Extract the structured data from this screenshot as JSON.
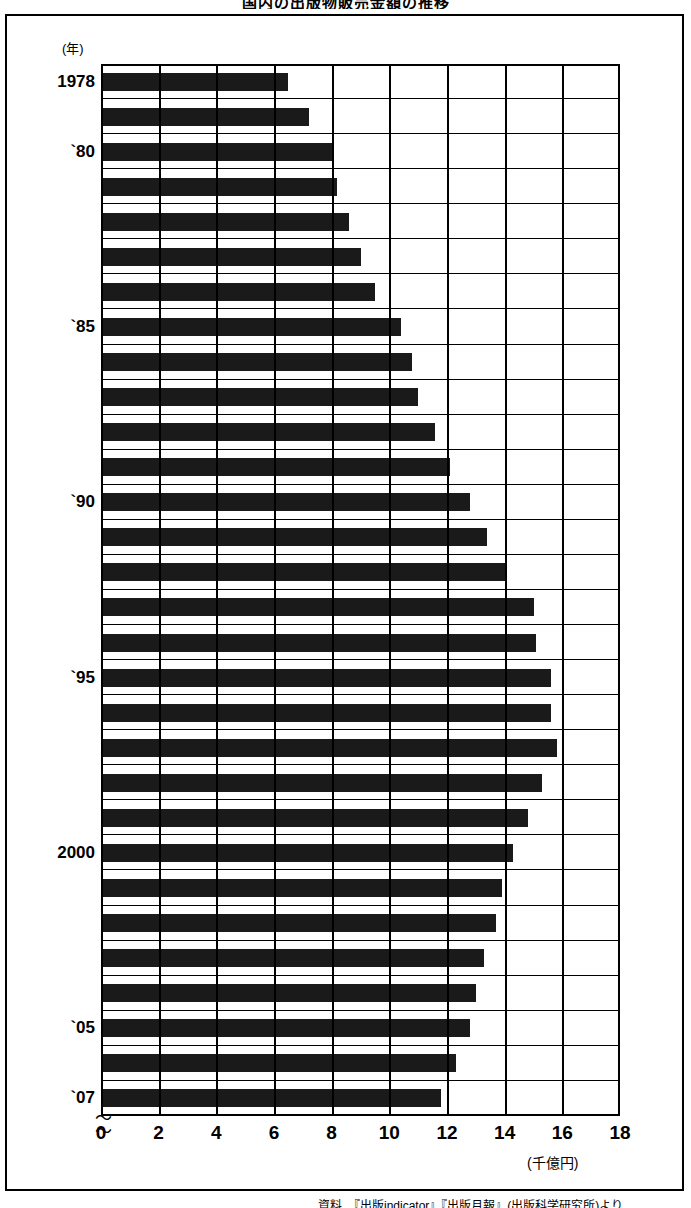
{
  "title": "国内の出版物販売金額の推移",
  "source": "資料　『出版indicator』『出版月報』(出版科学研究所)より",
  "y_axis": {
    "unit_label": "(年)",
    "tick_labels": [
      {
        "year": 1978,
        "text": "1978"
      },
      {
        "year": 1980,
        "text": "`80"
      },
      {
        "year": 1985,
        "text": "`85"
      },
      {
        "year": 1990,
        "text": "`90"
      },
      {
        "year": 1995,
        "text": "`95"
      },
      {
        "year": 2000,
        "text": "2000"
      },
      {
        "year": 2005,
        "text": "`05"
      },
      {
        "year": 2007,
        "text": "`07"
      }
    ]
  },
  "x_axis": {
    "unit_label": "(千億円)",
    "tick_labels": [
      "0",
      "2",
      "4",
      "6",
      "8",
      "10",
      "12",
      "14",
      "16",
      "18"
    ]
  },
  "colors": {
    "bar": "#1a1a1a",
    "axis": "#000000",
    "background": "#ffffff"
  },
  "chart_data": {
    "type": "bar",
    "orientation": "horizontal",
    "title": "国内の出版物販売金額の推移",
    "xlabel": "(千億円)",
    "ylabel": "(年)",
    "xlim": [
      0,
      18
    ],
    "xticks": [
      0,
      2,
      4,
      6,
      8,
      10,
      12,
      14,
      16,
      18
    ],
    "grid": true,
    "legend": false,
    "categories": [
      "1978",
      "1979",
      "1980",
      "1981",
      "1982",
      "1983",
      "1984",
      "1985",
      "1986",
      "1987",
      "1988",
      "1989",
      "1990",
      "1991",
      "1992",
      "1993",
      "1994",
      "1995",
      "1996",
      "1997",
      "1998",
      "1999",
      "2000",
      "2001",
      "2002",
      "2003",
      "2004",
      "2005",
      "2006",
      "2007"
    ],
    "values": [
      6.5,
      7.2,
      8.0,
      8.2,
      8.6,
      9.0,
      9.5,
      10.4,
      10.8,
      11.0,
      11.6,
      12.1,
      12.8,
      13.4,
      14.0,
      15.0,
      15.1,
      15.6,
      15.6,
      15.8,
      15.3,
      14.8,
      14.3,
      13.9,
      13.7,
      13.3,
      13.0,
      12.8,
      12.3,
      11.8
    ],
    "unit": "千億円"
  }
}
